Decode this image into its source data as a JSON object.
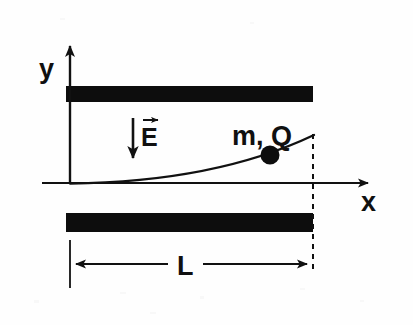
{
  "figure": {
    "background_color": "#fefefe",
    "ink_color": "#111111",
    "width": 413,
    "height": 325
  },
  "axes": {
    "y_label": "y",
    "x_label": "x",
    "origin": {
      "x": 70,
      "y": 183
    },
    "x_axis_end": {
      "x": 378,
      "y": 183
    },
    "y_axis_end": {
      "x": 70,
      "y": 36
    }
  },
  "field": {
    "label": "E",
    "vector_overbar": true,
    "direction": "down",
    "arrow_x": 133,
    "arrow_top_y": 118,
    "arrow_tip_y": 167
  },
  "particle": {
    "label": "m, Q",
    "dot_center": {
      "x": 270,
      "y": 155
    },
    "dot_radius": 9,
    "dot_color": "#0d0d0d"
  },
  "plates": {
    "color": "#0d0d0d",
    "left_x": 66,
    "right_x": 313,
    "top_plate": {
      "y": 86,
      "height": 16
    },
    "bottom_plate": {
      "y": 213,
      "height": 19
    }
  },
  "trajectory": {
    "shape": "parabola",
    "start": {
      "x": 70,
      "y": 183
    },
    "end": {
      "x": 314,
      "y": 135
    },
    "curvature": "upward",
    "stroke_width": 2.2
  },
  "dimension": {
    "label": "L",
    "line_y": 264,
    "start_x": 70,
    "end_x": 313,
    "label_x": 186,
    "label_gap_left": 168,
    "label_gap_right": 203,
    "dashed_guide_x": 313,
    "dashed_top_y": 134,
    "dashed_bottom_y": 272
  }
}
